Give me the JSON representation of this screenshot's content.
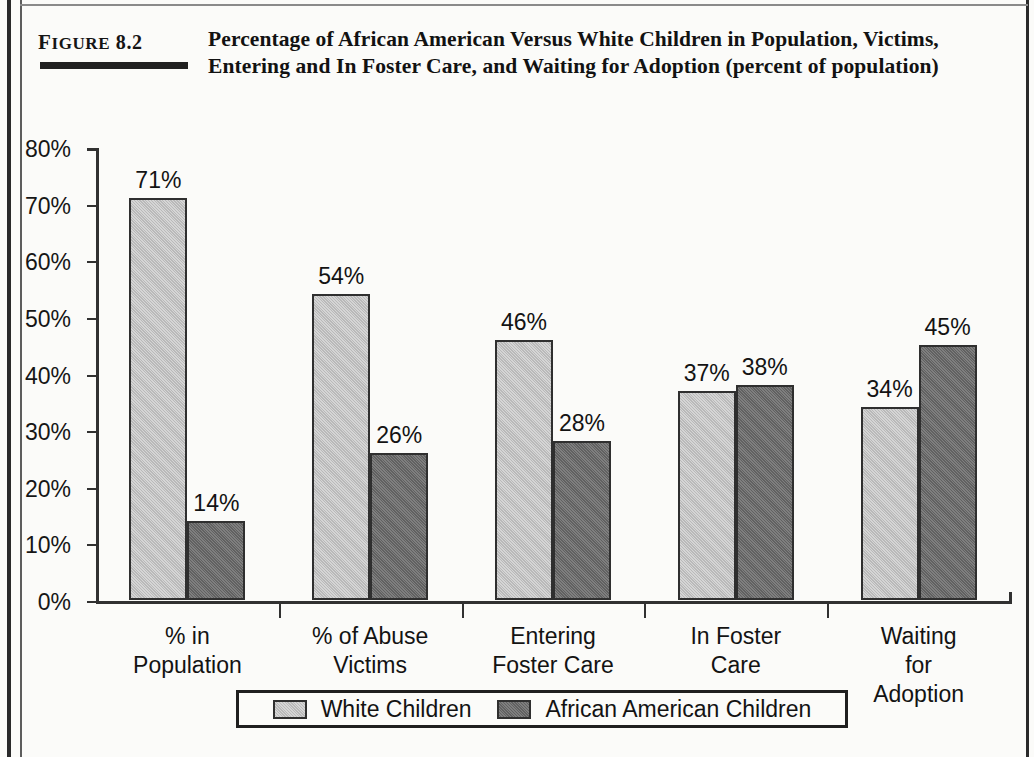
{
  "figure": {
    "label_prefix": "F",
    "label_rest": "IGURE",
    "label_number": "8.2",
    "title": "Percentage of African American Versus White Children in Population, Victims, Entering and In Foster Care, and Waiting for Adoption (percent of population)"
  },
  "colors": {
    "white_children": "#c3c3c3",
    "african_american_children": "#6c6c6c",
    "axis": "#313131",
    "text": "#131313"
  },
  "chart_data": {
    "type": "bar",
    "title": "Percentage of African American Versus White Children in Population, Victims, Entering and In Foster Care, and Waiting for Adoption (percent of population)",
    "xlabel": "",
    "ylabel": "",
    "ylim": [
      0,
      80
    ],
    "ytick_values": [
      0,
      10,
      20,
      30,
      40,
      50,
      60,
      70,
      80
    ],
    "ytick_labels": [
      "0%",
      "10%",
      "20%",
      "30%",
      "40%",
      "50%",
      "60%",
      "70%",
      "80%"
    ],
    "grid": false,
    "legend_position": "bottom",
    "categories": [
      "% in\nPopulation",
      "% of Abuse\nVictims",
      "Entering\nFoster Care",
      "In Foster\nCare",
      "Waiting for\nAdoption"
    ],
    "series": [
      {
        "name": "White Children",
        "color": "#c3c3c3",
        "values": [
          71,
          54,
          46,
          37,
          34
        ],
        "labels": [
          "71%",
          "54%",
          "46%",
          "37%",
          "34%"
        ]
      },
      {
        "name": "African American Children",
        "color": "#6c6c6c",
        "values": [
          14,
          26,
          28,
          38,
          45
        ],
        "labels": [
          "14%",
          "26%",
          "28%",
          "38%",
          "45%"
        ]
      }
    ]
  },
  "legend": {
    "items": [
      {
        "label": "White Children",
        "swatch": "light"
      },
      {
        "label": "African American Children",
        "swatch": "dark"
      }
    ]
  }
}
